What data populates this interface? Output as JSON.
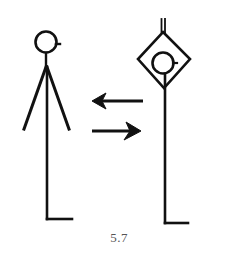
{
  "figure": {
    "caption": "5.7",
    "stroke_color": "#111111",
    "background": "#ffffff",
    "left_figure": {
      "label": "stick figure (plain)",
      "head": {
        "cx": 46,
        "cy": 42,
        "r": 11
      }
    },
    "right_figure": {
      "label": "stick figure enclosed in diamond",
      "head": {
        "cx": 163,
        "cy": 63,
        "r": 11
      }
    },
    "arrows": [
      {
        "direction": "left",
        "y": 101
      },
      {
        "direction": "right",
        "y": 131
      }
    ]
  }
}
